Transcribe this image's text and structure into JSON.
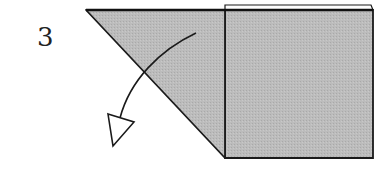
{
  "diagram": {
    "step_number": "3",
    "colors": {
      "paper_fill": "#b9b9b9",
      "stroke": "#1a1a1a",
      "background": "#ffffff"
    },
    "shapes": {
      "folded_triangle": "86,10 225,10 225,158",
      "square_panel": "225,10 373,10 373,158 225,158",
      "back_layer_strip": "225,5 371,5 373,10 225,10",
      "fold_arrow_path": "M196,33 C160,50 130,80 120,118",
      "arrow_head": "108,114 134,122 113,146"
    }
  }
}
